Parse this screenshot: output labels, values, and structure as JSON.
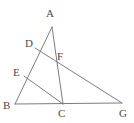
{
  "diagram": {
    "type": "euclidean-geometry-figure",
    "width": 134,
    "height": 123,
    "background_color": "#ffffff",
    "line_color": "#7d7d7d",
    "label_color": "#4a4a4a",
    "line_width": 1,
    "points": {
      "A": {
        "label": "A",
        "x": 52,
        "y": 27,
        "label_x": 46,
        "label_y": 8
      },
      "B": {
        "label": "B",
        "x": 15,
        "y": 104,
        "label_x": 3,
        "label_y": 100
      },
      "C": {
        "label": "C",
        "x": 63,
        "y": 104,
        "label_x": 58,
        "label_y": 108
      },
      "D": {
        "label": "D",
        "x": 35,
        "y": 48,
        "label_x": 25,
        "label_y": 38
      },
      "E": {
        "label": "E",
        "x": 24,
        "y": 76,
        "label_x": 13,
        "label_y": 67
      },
      "F": {
        "label": "F",
        "x": 55,
        "y": 61,
        "label_x": 57,
        "label_y": 51
      },
      "G": {
        "label": "G",
        "x": 122,
        "y": 103,
        "label_x": 119,
        "label_y": 108
      }
    },
    "segments": [
      {
        "name": "segment-A-B",
        "from": "A",
        "to": "B",
        "through": "D,E"
      },
      {
        "name": "segment-A-C",
        "from": "A",
        "to": "C",
        "through": "F"
      },
      {
        "name": "segment-B-G",
        "from": "B",
        "to": "G",
        "through": "C"
      },
      {
        "name": "segment-D-G",
        "from": "D",
        "to": "G",
        "through": "F"
      },
      {
        "name": "segment-E-C",
        "from": "E",
        "to": "C",
        "through": ""
      }
    ]
  }
}
